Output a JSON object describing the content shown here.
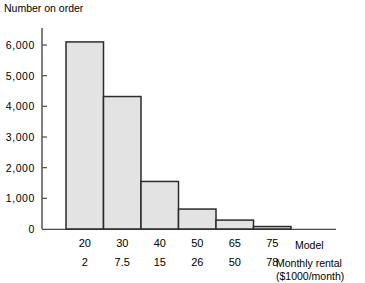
{
  "chart_data": {
    "type": "bar",
    "title": "",
    "ylabel": "Number on order",
    "xlabel": "Model",
    "xlabel2": "Monthly rental",
    "xlabel3": "($1000/month)",
    "categories": [
      "20",
      "30",
      "40",
      "50",
      "65",
      "75"
    ],
    "categories2": [
      "2",
      "7.5",
      "15",
      "26",
      "50",
      "78"
    ],
    "values": [
      6100,
      4320,
      1550,
      650,
      290,
      80
    ],
    "ylim": [
      0,
      6500
    ],
    "yticks": [
      0,
      1000,
      2000,
      3000,
      4000,
      5000,
      6000
    ],
    "ytick_labels": [
      "0",
      "1,000",
      "2,000",
      "3,000",
      "4,000",
      "5,000",
      "6,000"
    ],
    "grid": false,
    "legend": "none",
    "bar_fill": "#e3e3e3",
    "bar_edge": "#2b2b2b",
    "axis_color": "#4a4a4a"
  }
}
